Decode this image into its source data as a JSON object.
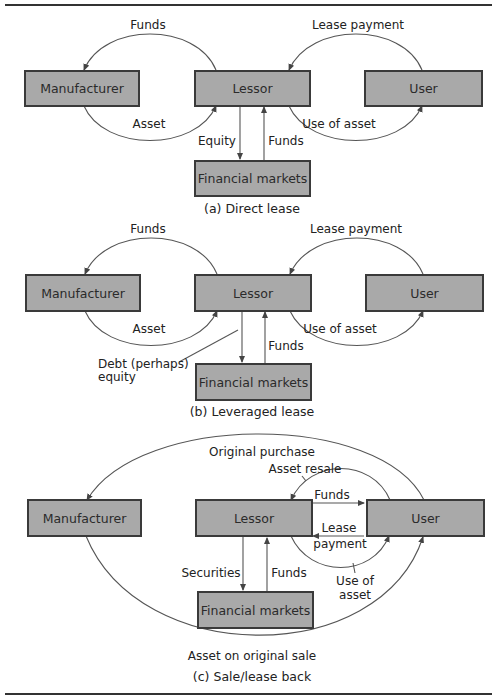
{
  "diagrams": {
    "a": {
      "caption": "(a) Direct lease",
      "nodes": {
        "manufacturer": "Manufacturer",
        "lessor": "Lessor",
        "user": "User",
        "financial_markets": "Financial markets"
      },
      "flows": {
        "lessor_to_manufacturer": "Funds",
        "user_to_lessor": "Lease payment",
        "manufacturer_to_lessor": "Asset",
        "lessor_to_user": "Use of asset",
        "lessor_to_markets": "Equity",
        "markets_to_lessor": "Funds"
      }
    },
    "b": {
      "caption": "(b) Leveraged lease",
      "nodes": {
        "manufacturer": "Manufacturer",
        "lessor": "Lessor",
        "user": "User",
        "financial_markets": "Financial markets"
      },
      "flows": {
        "lessor_to_manufacturer": "Funds",
        "user_to_lessor": "Lease payment",
        "manufacturer_to_lessor": "Asset",
        "lessor_to_user": "Use of asset",
        "lessor_to_markets_line1": "Debt (perhaps)",
        "lessor_to_markets_line2": "equity",
        "markets_to_lessor": "Funds"
      }
    },
    "c": {
      "caption": "(c) Sale/lease back",
      "nodes": {
        "manufacturer": "Manufacturer",
        "lessor": "Lessor",
        "user": "User",
        "financial_markets": "Financial markets"
      },
      "flows": {
        "user_to_manufacturer": "Original purchase",
        "user_to_lessor_resale": "Asset resale",
        "lessor_to_user_funds": "Funds",
        "user_to_lessor_line1": "Lease",
        "user_to_lessor_line2": "payment",
        "lessor_to_user_use_line1": "Use of",
        "lessor_to_user_use_line2": "asset",
        "lessor_to_markets": "Securities",
        "markets_to_lessor": "Funds",
        "manufacturer_to_user": "Asset on original sale"
      }
    }
  },
  "colors": {
    "box_fill": "#a9a9a9",
    "box_border": "#3a3a3a",
    "line": "#444444"
  }
}
